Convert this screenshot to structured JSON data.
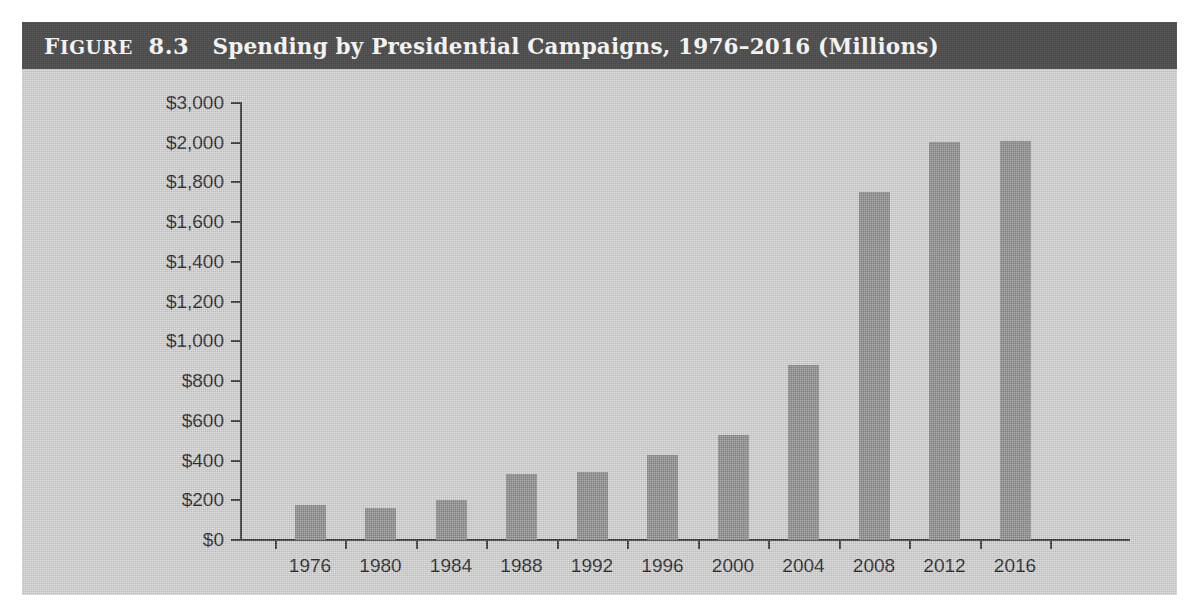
{
  "figure": {
    "label_word": "Figure",
    "number": "8.3",
    "title": "Spending by Presidential Campaigns, 1976–2016 (Millions)",
    "full_heading": "Figure 8.3  Spending by Presidential Campaigns, 1976–2016 (Millions)"
  },
  "colors": {
    "title_band": "#4d4d4d",
    "title_text": "#f2f2f2",
    "plot_background": "#cfcfcf",
    "bar_fill": "#8a8a8a",
    "axis": "#333333",
    "tick_text": "#1c1c1c",
    "page_background": "#ffffff"
  },
  "chart_data": {
    "type": "bar",
    "title": "Spending by Presidential Campaigns, 1976–2016 (Millions)",
    "xlabel": "",
    "ylabel": "",
    "categories": [
      "1976",
      "1980",
      "1984",
      "1988",
      "1992",
      "1996",
      "2000",
      "2004",
      "2008",
      "2012",
      "2016"
    ],
    "values": [
      175,
      162,
      203,
      330,
      341,
      426,
      529,
      881,
      1750,
      2010,
      2035
    ],
    "value_unit": "millions of dollars",
    "ytick_labels": [
      "$3,000",
      "$2,000",
      "$1,800",
      "$1,600",
      "$1,400",
      "$1,200",
      "$1,000",
      "$800",
      "$600",
      "$400",
      "$200",
      "$0"
    ],
    "ytick_values": [
      3000,
      2000,
      1800,
      1600,
      1400,
      1200,
      1000,
      800,
      600,
      400,
      200,
      0
    ],
    "ylim": [
      0,
      3000
    ],
    "y_axis_note": "axis scale breaks between $2,000 and $3,000 (ticks evenly spaced)",
    "xtick_labels": [
      "1976",
      "1980",
      "1984",
      "1988",
      "1992",
      "1996",
      "2000",
      "2004",
      "2008",
      "2012",
      "2016"
    ],
    "grid": false,
    "legend": null,
    "legend_position": "none",
    "series": [
      {
        "name": "Presidential campaign spending",
        "values": [
          175,
          162,
          203,
          330,
          341,
          426,
          529,
          881,
          1750,
          2010,
          2035
        ]
      }
    ]
  }
}
